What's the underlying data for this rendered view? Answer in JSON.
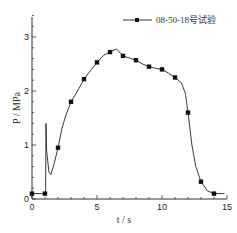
{
  "chart_data": {
    "type": "line",
    "title": "",
    "xlabel": "t / s",
    "ylabel": "P / MPa",
    "xlim": [
      0,
      15
    ],
    "ylim": [
      0,
      3.4
    ],
    "x_ticks": [
      0,
      5,
      10,
      15
    ],
    "y_ticks": [
      0,
      1,
      2,
      3
    ],
    "grid": false,
    "legend_position": "top-right",
    "series": [
      {
        "name": "08-50-18号试验",
        "marker": "square",
        "color": "#222222",
        "markers": [
          {
            "x": 0,
            "y": 0.1
          },
          {
            "x": 1,
            "y": 0.1
          },
          {
            "x": 2,
            "y": 0.95
          },
          {
            "x": 3,
            "y": 1.8
          },
          {
            "x": 4,
            "y": 2.22
          },
          {
            "x": 5,
            "y": 2.53
          },
          {
            "x": 6,
            "y": 2.72
          },
          {
            "x": 7,
            "y": 2.65
          },
          {
            "x": 8,
            "y": 2.57
          },
          {
            "x": 9,
            "y": 2.45
          },
          {
            "x": 10,
            "y": 2.4
          },
          {
            "x": 11,
            "y": 2.25
          },
          {
            "x": 12,
            "y": 1.6
          },
          {
            "x": 13,
            "y": 0.32
          },
          {
            "x": 14,
            "y": 0.1
          }
        ],
        "curve": [
          [
            0,
            0.1
          ],
          [
            1.05,
            0.1
          ],
          [
            1.08,
            1.4
          ],
          [
            1.12,
            0.9
          ],
          [
            1.3,
            0.5
          ],
          [
            1.45,
            0.45
          ],
          [
            1.7,
            0.65
          ],
          [
            2,
            0.95
          ],
          [
            2.3,
            1.3
          ],
          [
            2.6,
            1.55
          ],
          [
            3,
            1.8
          ],
          [
            3.5,
            2.0
          ],
          [
            4,
            2.22
          ],
          [
            4.5,
            2.38
          ],
          [
            5,
            2.53
          ],
          [
            5.5,
            2.66
          ],
          [
            6,
            2.72
          ],
          [
            6.5,
            2.78
          ],
          [
            7,
            2.65
          ],
          [
            7.5,
            2.61
          ],
          [
            8,
            2.57
          ],
          [
            8.5,
            2.5
          ],
          [
            9,
            2.45
          ],
          [
            9.5,
            2.42
          ],
          [
            10,
            2.4
          ],
          [
            10.5,
            2.33
          ],
          [
            11,
            2.25
          ],
          [
            11.5,
            2.15
          ],
          [
            11.8,
            1.95
          ],
          [
            12,
            1.6
          ],
          [
            12.3,
            1.0
          ],
          [
            12.6,
            0.6
          ],
          [
            13,
            0.32
          ],
          [
            13.5,
            0.15
          ],
          [
            14,
            0.1
          ],
          [
            14.8,
            0.1
          ]
        ]
      }
    ]
  }
}
